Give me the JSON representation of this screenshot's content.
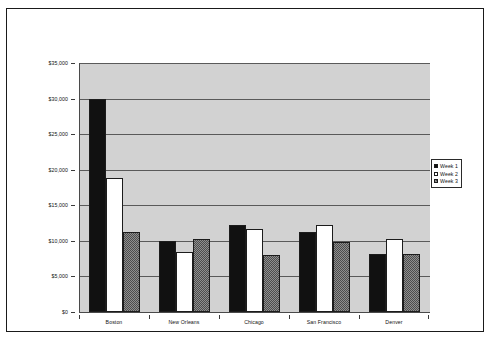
{
  "chart_data": {
    "type": "bar",
    "title": "",
    "subtitle": "",
    "xlabel": "",
    "ylabel": "",
    "categories": [
      "Boston",
      "New Orleans",
      "Chicago",
      "San Francisco",
      "Denver"
    ],
    "series": [
      {
        "name": "Week 1",
        "values": [
          30000,
          10000,
          12200,
          11200,
          8200
        ],
        "swatch": "black"
      },
      {
        "name": "Week 2",
        "values": [
          18800,
          8500,
          11700,
          12300,
          10300
        ],
        "swatch": "white"
      },
      {
        "name": "Week 3",
        "values": [
          11200,
          10300,
          8000,
          9900,
          8200
        ],
        "swatch": "gray-hatch"
      }
    ],
    "ylim": [
      0,
      35000
    ],
    "ytick_values": [
      35000,
      30000,
      25000,
      20000,
      15000,
      10000,
      5000,
      0
    ],
    "ytick_labels": [
      "$35,000",
      "$30,000",
      "$25,000",
      "$20,000",
      "$15,000",
      "$10,000",
      "$5,000",
      "$0"
    ],
    "grid": true,
    "grid_axis": "y",
    "legend": true,
    "legend_position": "right",
    "legend_entries": [
      "Week 1",
      "Week 2",
      "Week 3"
    ],
    "plot_background": "#d2d2d2",
    "figure_background": "#ffffff",
    "gridline_color": "#5a5a5a",
    "axis_color": "#4a4a4a",
    "border_color": "#1a1a1a"
  }
}
